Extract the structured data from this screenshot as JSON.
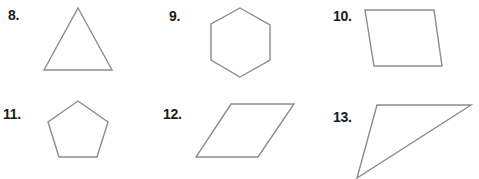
{
  "problems": [
    {
      "number": "8.",
      "shape": "triangle",
      "label_pos": [
        8,
        8
      ],
      "points": "78,8 112,70 44,70"
    },
    {
      "number": "9.",
      "shape": "hexagon",
      "label_pos": [
        169,
        9
      ],
      "points": "240,8 270,25 270,60 240,77 211,60 211,24"
    },
    {
      "number": "10.",
      "shape": "parallelogram",
      "label_pos": [
        333,
        9
      ],
      "points": "365,10 434,10 442,66 374,66"
    },
    {
      "number": "11.",
      "shape": "pentagon",
      "label_pos": [
        3,
        107
      ],
      "points": "78,101 108,122 97,157 59,157 48,122"
    },
    {
      "number": "12.",
      "shape": "rhombus",
      "label_pos": [
        163,
        107
      ],
      "points": "231,104 294,104 258,157 196,157"
    },
    {
      "number": "13.",
      "shape": "triangle",
      "label_pos": [
        333,
        110
      ],
      "points": "377,105 471,105 357,178"
    }
  ],
  "colors": {
    "stroke": "#8c8c8c",
    "label": "#1a1a1a",
    "background": "#ffffff"
  }
}
